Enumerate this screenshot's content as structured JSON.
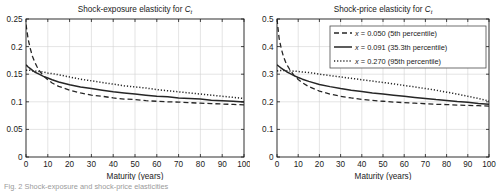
{
  "figure": {
    "caption": "Fig. 2  Shock-exposure and shock-price elasticities"
  },
  "legend": {
    "position": "top-right-of-right-panel",
    "entries": [
      {
        "style": "dashed",
        "label_math": "x",
        "label_rest": " = 0.050 (5th percentile)"
      },
      {
        "style": "solid",
        "label_math": "x",
        "label_rest": " = 0.091 (35.3th percentile)"
      },
      {
        "style": "dotted",
        "label_math": "x",
        "label_rest": " = 0.270 (95th percentile)"
      }
    ]
  },
  "chart_data": [
    {
      "type": "line",
      "id": "shock-exposure",
      "title_main": "Shock-exposure elasticity for ",
      "title_math": "C",
      "title_sub": "t",
      "xlabel": "Maturity (years)",
      "ylabel": "",
      "xlim": [
        0,
        100
      ],
      "ylim": [
        0,
        0.25
      ],
      "xticks": [
        0,
        10,
        20,
        30,
        40,
        50,
        60,
        70,
        80,
        90,
        100
      ],
      "yticks": [
        0,
        0.05,
        0.1,
        0.15,
        0.2,
        0.25
      ],
      "ytick_labels": [
        "0",
        "0.05",
        "0.1",
        "0.15",
        "0.2",
        "0.25"
      ],
      "grid": true,
      "x": [
        0,
        1,
        2,
        3,
        4,
        5,
        6,
        8,
        10,
        12,
        15,
        20,
        25,
        30,
        35,
        40,
        45,
        50,
        55,
        60,
        65,
        70,
        75,
        80,
        85,
        90,
        95,
        100
      ],
      "series": [
        {
          "name": "x = 0.050 (5th percentile)",
          "style": "dashed",
          "values": [
            0.24,
            0.213,
            0.196,
            0.182,
            0.172,
            0.164,
            0.157,
            0.147,
            0.14,
            0.134,
            0.128,
            0.121,
            0.116,
            0.112,
            0.11,
            0.107,
            0.105,
            0.104,
            0.102,
            0.101,
            0.1,
            0.0995,
            0.0985,
            0.0975,
            0.0968,
            0.096,
            0.0952,
            0.0945
          ]
        },
        {
          "name": "x = 0.091 (35.3th percentile)",
          "style": "solid",
          "values": [
            0.167,
            0.163,
            0.16,
            0.157,
            0.154,
            0.152,
            0.15,
            0.146,
            0.143,
            0.14,
            0.136,
            0.131,
            0.127,
            0.124,
            0.121,
            0.118,
            0.116,
            0.114,
            0.112,
            0.11,
            0.109,
            0.107,
            0.106,
            0.105,
            0.103,
            0.102,
            0.101,
            0.0995
          ]
        },
        {
          "name": "x = 0.270 (95th percentile)",
          "style": "dotted",
          "values": [
            0.157,
            0.157,
            0.157,
            0.156,
            0.156,
            0.155,
            0.155,
            0.154,
            0.152,
            0.151,
            0.149,
            0.145,
            0.141,
            0.138,
            0.135,
            0.132,
            0.129,
            0.127,
            0.125,
            0.122,
            0.12,
            0.118,
            0.116,
            0.114,
            0.112,
            0.11,
            0.108,
            0.106
          ]
        }
      ]
    },
    {
      "type": "line",
      "id": "shock-price",
      "title_main": "Shock-price elasticity for ",
      "title_math": "C",
      "title_sub": "t",
      "xlabel": "Maturity (years)",
      "ylabel": "",
      "xlim": [
        0,
        100
      ],
      "ylim": [
        0,
        0.5
      ],
      "xticks": [
        0,
        10,
        20,
        30,
        40,
        50,
        60,
        70,
        80,
        90,
        100
      ],
      "yticks": [
        0,
        0.1,
        0.2,
        0.3,
        0.4,
        0.5
      ],
      "ytick_labels": [
        "0",
        "0.1",
        "0.2",
        "0.3",
        "0.4",
        "0.5"
      ],
      "grid": true,
      "x": [
        0,
        1,
        2,
        3,
        4,
        5,
        6,
        8,
        10,
        12,
        15,
        20,
        25,
        30,
        35,
        40,
        45,
        50,
        55,
        60,
        65,
        70,
        75,
        80,
        85,
        90,
        95,
        100
      ],
      "series": [
        {
          "name": "x = 0.050 (5th percentile)",
          "style": "dashed",
          "values": [
            0.5,
            0.43,
            0.393,
            0.365,
            0.345,
            0.33,
            0.317,
            0.296,
            0.281,
            0.269,
            0.255,
            0.239,
            0.228,
            0.22,
            0.214,
            0.209,
            0.205,
            0.202,
            0.199,
            0.197,
            0.195,
            0.193,
            0.191,
            0.19,
            0.188,
            0.187,
            0.186,
            0.184
          ]
        },
        {
          "name": "x = 0.091 (35.3th percentile)",
          "style": "solid",
          "values": [
            0.334,
            0.328,
            0.322,
            0.317,
            0.312,
            0.307,
            0.303,
            0.295,
            0.288,
            0.282,
            0.274,
            0.263,
            0.255,
            0.248,
            0.242,
            0.237,
            0.232,
            0.228,
            0.224,
            0.22,
            0.216,
            0.212,
            0.208,
            0.205,
            0.201,
            0.198,
            0.194,
            0.191
          ]
        },
        {
          "name": "x = 0.270 (95th percentile)",
          "style": "dotted",
          "values": [
            0.312,
            0.313,
            0.313,
            0.313,
            0.313,
            0.312,
            0.312,
            0.311,
            0.31,
            0.308,
            0.306,
            0.3,
            0.295,
            0.29,
            0.285,
            0.28,
            0.275,
            0.27,
            0.265,
            0.259,
            0.254,
            0.248,
            0.242,
            0.235,
            0.228,
            0.22,
            0.212,
            0.203
          ]
        }
      ]
    }
  ],
  "style": {
    "axis_color": "#1a1a1a",
    "grid_color": "#d2d2d2",
    "curve_color": "#262626",
    "bg": "#ffffff"
  }
}
